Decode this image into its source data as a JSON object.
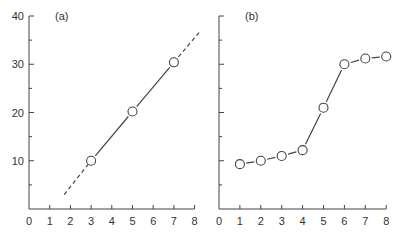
{
  "chart_data": [
    {
      "type": "line",
      "panel_label": "(a)",
      "x": [
        3,
        5,
        7
      ],
      "values": [
        10,
        20.2,
        30.4
      ],
      "extrapolation": {
        "style": "dashed",
        "from": [
          1.7,
          3
        ],
        "to": [
          8.3,
          37
        ]
      },
      "xticks": [
        "0",
        "1",
        "2",
        "3",
        "4",
        "5",
        "6",
        "7",
        "8"
      ],
      "yticks": [
        "10",
        "20",
        "30",
        "40"
      ],
      "xlim": [
        0,
        8
      ],
      "ylim": [
        0,
        40
      ],
      "marker": "open-circle",
      "grid": false
    },
    {
      "type": "line",
      "panel_label": "(b)",
      "x": [
        1,
        2,
        3,
        4,
        5,
        6,
        7,
        8
      ],
      "values": [
        9.3,
        10,
        11,
        12.2,
        21,
        30,
        31.2,
        31.6
      ],
      "xticks": [
        "0",
        "1",
        "2",
        "3",
        "4",
        "5",
        "6",
        "7",
        "8"
      ],
      "yticks": [],
      "xlim": [
        0,
        8
      ],
      "ylim": [
        0,
        40
      ],
      "marker": "open-circle",
      "grid": false
    }
  ],
  "labels": {
    "panel_a": "(a)",
    "panel_b": "(b)",
    "y40": "40",
    "y30": "30",
    "y20": "20",
    "y10": "10",
    "x": [
      "0",
      "1",
      "2",
      "3",
      "4",
      "5",
      "6",
      "7",
      "8"
    ]
  }
}
